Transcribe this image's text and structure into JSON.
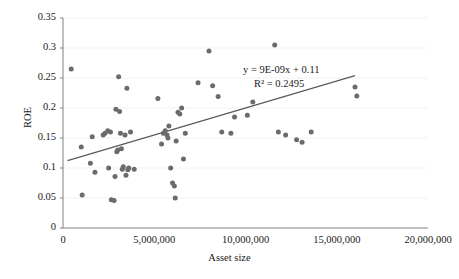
{
  "chart_data": {
    "type": "scatter",
    "title": "",
    "xlabel": "Asset size",
    "ylabel": "ROE",
    "xlim": [
      0,
      20000000
    ],
    "ylim": [
      0,
      0.35
    ],
    "xticks": [
      0,
      5000000,
      10000000,
      15000000,
      20000000
    ],
    "xtick_labels": [
      "0",
      "5,000,000",
      "10,000,000",
      "15,000,000",
      "20,000,000"
    ],
    "yticks": [
      0,
      0.05,
      0.1,
      0.15,
      0.2,
      0.25,
      0.3,
      0.35
    ],
    "ytick_labels": [
      "0",
      "0.05",
      "0.1",
      "0.15",
      "0.2",
      "0.25",
      "0.3",
      "0.35"
    ],
    "grid": true,
    "grid_axis": "y",
    "legend": false,
    "marker_color": "#6b6b6b",
    "marker_size": 5,
    "trendline": {
      "equation_label": "y = 9E-09x + 0.11",
      "r2_label": "R² = 0.2495",
      "slope": 9e-09,
      "intercept": 0.11,
      "r2": 0.2495,
      "color": "#595959",
      "x_start": 250000,
      "x_end": 16000000
    },
    "points": [
      [
        450000,
        0.265
      ],
      [
        1000000,
        0.135
      ],
      [
        1050000,
        0.055
      ],
      [
        1500000,
        0.108
      ],
      [
        1600000,
        0.152
      ],
      [
        1750000,
        0.093
      ],
      [
        2200000,
        0.155
      ],
      [
        2300000,
        0.158
      ],
      [
        2450000,
        0.162
      ],
      [
        2500000,
        0.1
      ],
      [
        2600000,
        0.16
      ],
      [
        2650000,
        0.047
      ],
      [
        2800000,
        0.046
      ],
      [
        2850000,
        0.086
      ],
      [
        2900000,
        0.198
      ],
      [
        2950000,
        0.127
      ],
      [
        3000000,
        0.13
      ],
      [
        3050000,
        0.252
      ],
      [
        3100000,
        0.194
      ],
      [
        3150000,
        0.158
      ],
      [
        3200000,
        0.132
      ],
      [
        3250000,
        0.098
      ],
      [
        3300000,
        0.102
      ],
      [
        3400000,
        0.155
      ],
      [
        3450000,
        0.088
      ],
      [
        3500000,
        0.233
      ],
      [
        3550000,
        0.097
      ],
      [
        3600000,
        0.1
      ],
      [
        3700000,
        0.16
      ],
      [
        3900000,
        0.098
      ],
      [
        5200000,
        0.216
      ],
      [
        5400000,
        0.14
      ],
      [
        5500000,
        0.158
      ],
      [
        5600000,
        0.162
      ],
      [
        5700000,
        0.155
      ],
      [
        5750000,
        0.15
      ],
      [
        5800000,
        0.17
      ],
      [
        5900000,
        0.1
      ],
      [
        6000000,
        0.075
      ],
      [
        6100000,
        0.07
      ],
      [
        6150000,
        0.05
      ],
      [
        6200000,
        0.145
      ],
      [
        6300000,
        0.193
      ],
      [
        6400000,
        0.19
      ],
      [
        6500000,
        0.2
      ],
      [
        6600000,
        0.115
      ],
      [
        6700000,
        0.158
      ],
      [
        7400000,
        0.242
      ],
      [
        8000000,
        0.295
      ],
      [
        8200000,
        0.237
      ],
      [
        8500000,
        0.219
      ],
      [
        8700000,
        0.16
      ],
      [
        9200000,
        0.158
      ],
      [
        9400000,
        0.185
      ],
      [
        10100000,
        0.188
      ],
      [
        10400000,
        0.21
      ],
      [
        11600000,
        0.305
      ],
      [
        11800000,
        0.16
      ],
      [
        12200000,
        0.155
      ],
      [
        12800000,
        0.147
      ],
      [
        13100000,
        0.143
      ],
      [
        13600000,
        0.16
      ],
      [
        16000000,
        0.235
      ],
      [
        16100000,
        0.22
      ]
    ]
  }
}
